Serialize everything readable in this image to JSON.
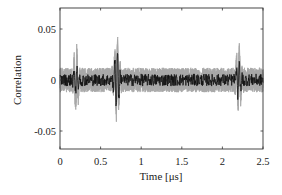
{
  "chart_data": {
    "type": "line",
    "title": "",
    "xlabel": "Time [μs]",
    "ylabel": "Correlation",
    "xlim": [
      0,
      2.5
    ],
    "ylim": [
      -0.07,
      0.07
    ],
    "xticks": [
      0,
      0.5,
      1,
      1.5,
      2,
      2.5
    ],
    "xtick_labels": [
      "0",
      "0.5",
      "1",
      "1.5",
      "2",
      "2.5"
    ],
    "yticks": [
      0.05,
      0,
      -0.05
    ],
    "ytick_labels": [
      "0.05",
      "0",
      "-0.05"
    ],
    "grid": false,
    "legend": null,
    "series": [
      {
        "name": "envelope (gray)",
        "color": "#a8a8a8",
        "noise_band": 0.012,
        "bursts": [
          {
            "t": 0.2,
            "peak": 0.031,
            "trough": -0.026
          },
          {
            "t": 0.7,
            "peak": 0.043,
            "trough": -0.038
          },
          {
            "t": 2.2,
            "peak": 0.031,
            "trough": -0.027
          }
        ]
      },
      {
        "name": "mean correlation (black)",
        "color": "#111111",
        "noise_band": 0.006,
        "bursts": [
          {
            "t": 0.2,
            "peak": 0.015,
            "trough": -0.013
          },
          {
            "t": 0.7,
            "peak": 0.04,
            "trough": -0.035
          },
          {
            "t": 2.2,
            "peak": 0.022,
            "trough": -0.018
          }
        ]
      }
    ]
  },
  "colors": {
    "axis": "#333333",
    "gray_band": "#a8a8a8",
    "black_trace": "#111111",
    "background": "#ffffff"
  }
}
